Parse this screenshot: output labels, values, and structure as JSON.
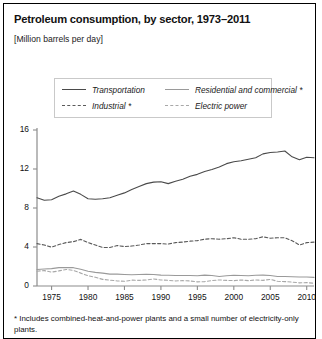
{
  "title": "Petroleum consumption, by sector, 1973–2011",
  "subtitle": "[Million barrels per day]",
  "footnote": "* Includes combined-heat-and-power plants and a small number of electricity-only plants.",
  "legend": {
    "items": [
      {
        "label": "Transportation",
        "style": "solid",
        "color": "#4a4a4a"
      },
      {
        "label": "Residential and commercial *",
        "style": "solid",
        "color": "#9a9a9a"
      },
      {
        "label": "Industrial *",
        "style": "dashed",
        "color": "#5a5a5a"
      },
      {
        "label": "Electric power",
        "style": "dashed",
        "color": "#a8a8a8"
      }
    ]
  },
  "axis": {
    "y_ticks": [
      "0",
      "4",
      "8",
      "12",
      "16"
    ],
    "x_ticks": [
      "1975",
      "1980",
      "1985",
      "1990",
      "1995",
      "2000",
      "2005",
      "2010"
    ]
  },
  "chart_data": {
    "type": "line",
    "title": "Petroleum consumption, by sector, 1973–2011",
    "subtitle": "[Million barrels per day]",
    "xlabel": "",
    "ylabel": "Million barrels per day",
    "xlim": [
      1973,
      2011
    ],
    "ylim": [
      0,
      16
    ],
    "yticks": [
      0,
      4,
      8,
      12,
      16
    ],
    "xticks": [
      1975,
      1980,
      1985,
      1990,
      1995,
      2000,
      2005,
      2010
    ],
    "grid": false,
    "legend_position": "top",
    "x": [
      1973,
      1974,
      1975,
      1976,
      1977,
      1978,
      1979,
      1980,
      1981,
      1982,
      1983,
      1984,
      1985,
      1986,
      1987,
      1988,
      1989,
      1990,
      1991,
      1992,
      1993,
      1994,
      1995,
      1996,
      1997,
      1998,
      1999,
      2000,
      2001,
      2002,
      2003,
      2004,
      2005,
      2006,
      2007,
      2008,
      2009,
      2010,
      2011
    ],
    "series": [
      {
        "name": "Transportation",
        "style": "solid",
        "color": "#4a4a4a",
        "values": [
          9.05,
          8.8,
          8.85,
          9.2,
          9.45,
          9.75,
          9.4,
          8.95,
          8.9,
          8.95,
          9.05,
          9.3,
          9.55,
          9.9,
          10.2,
          10.5,
          10.65,
          10.7,
          10.5,
          10.75,
          10.95,
          11.25,
          11.45,
          11.75,
          11.95,
          12.2,
          12.55,
          12.75,
          12.85,
          13.0,
          13.15,
          13.55,
          13.7,
          13.75,
          13.85,
          13.25,
          12.95,
          13.2,
          13.15
        ]
      },
      {
        "name": "Residential and commercial *",
        "style": "solid",
        "color": "#9a9a9a",
        "values": [
          1.7,
          1.75,
          1.78,
          1.88,
          1.9,
          1.88,
          1.72,
          1.52,
          1.4,
          1.32,
          1.22,
          1.22,
          1.18,
          1.15,
          1.18,
          1.2,
          1.18,
          1.12,
          1.1,
          1.08,
          1.08,
          1.08,
          1.05,
          1.12,
          1.08,
          0.98,
          1.05,
          1.1,
          1.08,
          1.05,
          1.1,
          1.12,
          1.08,
          0.98,
          0.98,
          0.95,
          0.92,
          0.92,
          0.88
        ]
      },
      {
        "name": "Industrial *",
        "style": "dashed",
        "color": "#5a5a5a",
        "values": [
          4.35,
          4.2,
          3.98,
          4.25,
          4.45,
          4.55,
          4.78,
          4.45,
          4.2,
          3.95,
          3.95,
          4.15,
          4.05,
          4.1,
          4.2,
          4.35,
          4.35,
          4.35,
          4.3,
          4.45,
          4.5,
          4.6,
          4.65,
          4.8,
          4.85,
          4.8,
          4.85,
          4.95,
          4.8,
          4.8,
          4.85,
          5.05,
          4.9,
          4.95,
          4.95,
          4.65,
          4.2,
          4.45,
          4.5
        ]
      },
      {
        "name": "Electric power",
        "style": "dashed",
        "color": "#a8a8a8",
        "values": [
          1.52,
          1.58,
          1.42,
          1.55,
          1.7,
          1.6,
          1.32,
          1.05,
          0.9,
          0.68,
          0.6,
          0.52,
          0.48,
          0.6,
          0.58,
          0.62,
          0.72,
          0.62,
          0.58,
          0.52,
          0.55,
          0.52,
          0.42,
          0.45,
          0.55,
          0.62,
          0.58,
          0.55,
          0.62,
          0.55,
          0.62,
          0.58,
          0.68,
          0.48,
          0.45,
          0.4,
          0.32,
          0.35,
          0.28
        ]
      }
    ]
  }
}
